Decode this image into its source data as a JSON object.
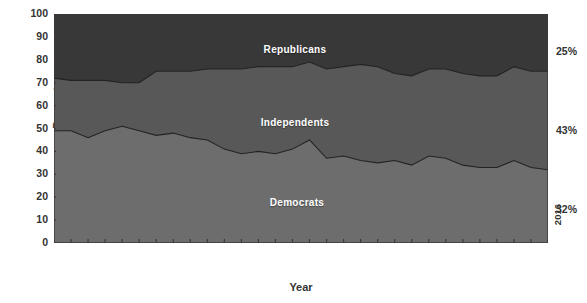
{
  "chart_data": {
    "type": "area",
    "title": "",
    "subtitle": "",
    "xlabel": "Year",
    "ylabel": "Percentage",
    "ylim": [
      0,
      100
    ],
    "yticks": [
      0,
      10,
      20,
      30,
      40,
      50,
      60,
      70,
      80,
      90,
      100
    ],
    "grid": false,
    "stacked": true,
    "legend_position": "inline-labels",
    "annotations": [
      {
        "text": "Republicans",
        "position": "upper-band-center"
      },
      {
        "text": "Independents",
        "position": "middle-band-center"
      },
      {
        "text": "Democrats",
        "position": "lower-band-center"
      }
    ],
    "end_labels": [
      {
        "series": "Republicans",
        "text": "25%",
        "value": 25
      },
      {
        "series": "Independents",
        "text": "43%",
        "value": 43
      },
      {
        "series": "Democrats",
        "text": "32%",
        "value": 32
      }
    ],
    "xtick_labels": [
      "1952",
      "1954",
      "1956",
      "1958",
      "1960",
      "1962",
      "1964",
      "1966",
      "1968",
      "1970",
      "1972",
      "1974",
      "1976",
      "1978",
      "1980",
      "1982",
      "1984",
      "1986",
      "1988",
      "1990",
      "1992",
      "1994",
      "1996",
      "1998",
      "2000",
      "2002",
      "2004",
      "2008",
      "2012",
      "2016"
    ],
    "x": [
      1952,
      1954,
      1956,
      1958,
      1960,
      1962,
      1964,
      1966,
      1968,
      1970,
      1972,
      1974,
      1976,
      1978,
      1980,
      1982,
      1984,
      1986,
      1988,
      1990,
      1992,
      1994,
      1996,
      1998,
      2000,
      2002,
      2004,
      2008,
      2012,
      2016
    ],
    "series": [
      {
        "name": "Democrats",
        "color": "#6d6d6d",
        "values": [
          49,
          49,
          46,
          49,
          51,
          49,
          47,
          48,
          46,
          45,
          41,
          39,
          40,
          39,
          41,
          45,
          37,
          38,
          36,
          35,
          36,
          34,
          38,
          37,
          34,
          33,
          33,
          36,
          33,
          32
        ]
      },
      {
        "name": "Independents",
        "color": "#585858",
        "values": [
          23,
          22,
          25,
          22,
          19,
          21,
          28,
          27,
          29,
          31,
          35,
          37,
          37,
          38,
          36,
          34,
          39,
          39,
          42,
          42,
          38,
          39,
          38,
          39,
          40,
          40,
          40,
          41,
          42,
          43
        ]
      },
      {
        "name": "Republicans",
        "color": "#383838",
        "values": [
          28,
          29,
          29,
          29,
          30,
          30,
          25,
          25,
          25,
          24,
          24,
          24,
          23,
          23,
          23,
          21,
          24,
          23,
          22,
          23,
          26,
          27,
          24,
          24,
          26,
          27,
          27,
          23,
          25,
          25
        ]
      }
    ],
    "cumulative_dem_top": [
      49,
      49,
      46,
      49,
      51,
      49,
      47,
      48,
      46,
      45,
      41,
      39,
      40,
      39,
      41,
      45,
      37,
      38,
      36,
      35,
      36,
      34,
      38,
      37,
      34,
      33,
      33,
      36,
      33,
      32
    ],
    "cumulative_ind_top": [
      72,
      71,
      71,
      71,
      70,
      70,
      75,
      75,
      75,
      76,
      76,
      76,
      77,
      77,
      77,
      79,
      76,
      77,
      78,
      77,
      74,
      73,
      76,
      76,
      74,
      73,
      73,
      77,
      75,
      75
    ]
  },
  "colors": {
    "democrats": "#6d6d6d",
    "independents": "#585858",
    "republicans": "#383838",
    "boundary": "#232323",
    "axis": "#3a3a3a",
    "text": "#333333",
    "label_text": "#ffffff",
    "background": "#ffffff"
  }
}
